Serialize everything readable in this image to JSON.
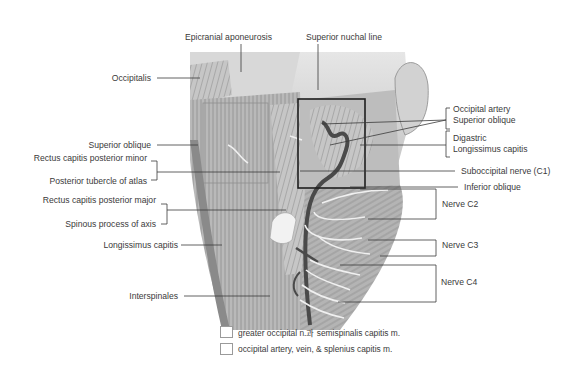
{
  "diagram": {
    "labels_left": [
      {
        "id": "occipitalis",
        "text": "Occipitalis"
      },
      {
        "id": "superior-oblique-left",
        "text": "Superior oblique"
      },
      {
        "id": "rectus-minor",
        "text": "Rectus capitis posterior minor"
      },
      {
        "id": "posterior-tubercle",
        "text": "Posterior tubercle of atlas"
      },
      {
        "id": "rectus-major",
        "text": "Rectus capitis posterior major"
      },
      {
        "id": "spinous-process",
        "text": "Spinous process of axis"
      },
      {
        "id": "longissimus-left",
        "text": "Longissimus capitis"
      },
      {
        "id": "interspinales",
        "text": "Interspinales"
      }
    ],
    "labels_top": [
      {
        "id": "epicranial",
        "text": "Epicranial aponeurosis"
      },
      {
        "id": "nuchal-line",
        "text": "Superior nuchal line"
      }
    ],
    "labels_right": [
      {
        "id": "occipital-artery",
        "text": "Occipital artery"
      },
      {
        "id": "superior-oblique-right",
        "text": "Superior oblique"
      },
      {
        "id": "digastric",
        "text": "Digastric"
      },
      {
        "id": "longissimus-right",
        "text": "Longissimus capitis"
      },
      {
        "id": "suboccipital-nerve",
        "text": "Suboccipital nerve (C1)"
      },
      {
        "id": "inferior-oblique",
        "text": "Inferior oblique"
      },
      {
        "id": "nerve-c2",
        "text": "Nerve C2"
      },
      {
        "id": "nerve-c3",
        "text": "Nerve C3"
      },
      {
        "id": "nerve-c4",
        "text": "Nerve C4"
      }
    ]
  },
  "legend": [
    {
      "text": "greater occipital n.과 semispinalis capitis m."
    },
    {
      "text": "occipital artery, vein, & splenius capitis m."
    }
  ],
  "colors": {
    "muscle_light": "#c9c9c9",
    "muscle_mid": "#a8a8a8",
    "muscle_dark": "#6e6e6e",
    "artery": "#4a4a4a",
    "nerve": "#efefef",
    "leader": "#3a3a3a"
  }
}
